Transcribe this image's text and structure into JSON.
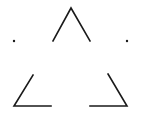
{
  "figure": {
    "description": "Illusory (subjective) triangle formed by three angular corner fragments with two isolated dots",
    "stroke_color": "#1a1a1a",
    "background": "#ffffff",
    "stroke_width": 1.6
  },
  "fragments": [
    {
      "name": "top-apex",
      "points": "53,41 71,8 90,41"
    },
    {
      "name": "bottom-left-corner",
      "points": "33,75 14,106 51,106"
    },
    {
      "name": "bottom-right-corner",
      "points": "108,74 127,106 90,106"
    }
  ],
  "dots": [
    {
      "name": "left-dot",
      "cx": 14,
      "cy": 41,
      "r": 1.2
    },
    {
      "name": "right-dot",
      "cx": 127,
      "cy": 41,
      "r": 1.2
    }
  ]
}
